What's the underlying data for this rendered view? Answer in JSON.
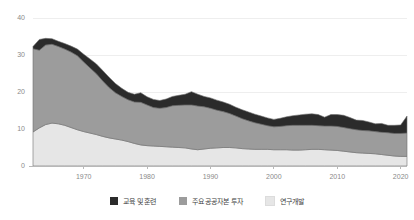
{
  "chart_data": {
    "type": "area",
    "title": "",
    "subtitle": "",
    "xlabel": "",
    "ylabel": "",
    "stacked": true,
    "grid": true,
    "legend_position": "bottom",
    "xlim": [
      1962,
      2021
    ],
    "ylim": [
      0,
      40
    ],
    "ytick_values": [
      0,
      10,
      20,
      30,
      40
    ],
    "ytick_labels": [
      "0",
      "10",
      "20",
      "30",
      "40"
    ],
    "xtick_values": [
      1970,
      1980,
      1990,
      2000,
      2010,
      2020
    ],
    "xtick_labels": [
      "1970",
      "1980",
      "1990",
      "2000",
      "2010",
      "2020"
    ],
    "x": [
      1962,
      1963,
      1964,
      1965,
      1966,
      1967,
      1968,
      1969,
      1970,
      1971,
      1972,
      1973,
      1974,
      1975,
      1976,
      1977,
      1978,
      1979,
      1980,
      1981,
      1982,
      1983,
      1984,
      1985,
      1986,
      1987,
      1988,
      1989,
      1990,
      1991,
      1992,
      1993,
      1994,
      1995,
      1996,
      1997,
      1998,
      1999,
      2000,
      2001,
      2002,
      2003,
      2004,
      2005,
      2006,
      2007,
      2008,
      2009,
      2010,
      2011,
      2012,
      2013,
      2014,
      2015,
      2016,
      2017,
      2018,
      2019,
      2020,
      2021
    ],
    "series": [
      {
        "name": "연구개발",
        "color": "#e6e6e6",
        "order": 1,
        "values": [
          9.2,
          10.3,
          11.2,
          11.6,
          11.4,
          11.0,
          10.4,
          9.8,
          9.3,
          8.9,
          8.5,
          8.0,
          7.6,
          7.3,
          7.0,
          6.6,
          6.1,
          5.7,
          5.5,
          5.4,
          5.3,
          5.2,
          5.1,
          5.0,
          4.9,
          4.6,
          4.4,
          4.6,
          4.8,
          4.9,
          5.0,
          5.0,
          4.9,
          4.7,
          4.6,
          4.5,
          4.5,
          4.5,
          4.4,
          4.4,
          4.4,
          4.3,
          4.3,
          4.4,
          4.5,
          4.5,
          4.4,
          4.3,
          4.2,
          4.0,
          3.8,
          3.6,
          3.5,
          3.4,
          3.3,
          3.1,
          2.9,
          2.7,
          2.6,
          2.6
        ]
      },
      {
        "name": "주요 공공자본 투자",
        "color": "#9c9c9c",
        "order": 2,
        "values": [
          22.5,
          21.0,
          21.5,
          21.3,
          20.9,
          20.6,
          20.4,
          20.0,
          18.8,
          17.6,
          16.4,
          15.0,
          13.6,
          12.5,
          11.8,
          11.3,
          11.2,
          11.5,
          11.0,
          10.4,
          10.3,
          10.6,
          11.2,
          11.4,
          11.6,
          11.9,
          11.8,
          11.4,
          10.8,
          10.2,
          9.7,
          9.2,
          8.6,
          8.1,
          7.6,
          7.2,
          6.8,
          6.4,
          6.2,
          6.3,
          6.5,
          6.7,
          6.7,
          6.6,
          6.5,
          6.4,
          6.4,
          6.5,
          6.5,
          6.4,
          6.3,
          6.2,
          6.1,
          6.1,
          6.0,
          6.0,
          6.1,
          6.1,
          6.2,
          6.3
        ]
      },
      {
        "name": "교육 및 훈련",
        "color": "#2b2b2b",
        "order": 3,
        "values": [
          0.6,
          2.9,
          1.8,
          1.5,
          1.4,
          1.5,
          1.6,
          1.8,
          2.1,
          2.4,
          2.7,
          2.8,
          2.8,
          2.5,
          2.2,
          2.0,
          2.1,
          2.6,
          2.2,
          2.2,
          2.1,
          2.3,
          2.5,
          2.7,
          2.9,
          3.6,
          3.2,
          2.8,
          2.8,
          2.7,
          2.6,
          2.5,
          2.4,
          2.4,
          2.4,
          2.3,
          2.2,
          2.1,
          2.0,
          2.2,
          2.4,
          2.6,
          2.8,
          3.0,
          3.1,
          3.0,
          2.4,
          3.1,
          3.2,
          3.3,
          3.0,
          2.6,
          2.7,
          2.4,
          2.1,
          2.4,
          2.0,
          2.2,
          2.3,
          4.6
        ]
      }
    ],
    "totals": [
      32.3,
      34.2,
      34.5,
      34.4,
      33.7,
      33.1,
      32.4,
      31.6,
      30.2,
      28.9,
      27.6,
      25.8,
      24.0,
      22.3,
      21.0,
      19.9,
      19.4,
      19.8,
      18.7,
      18.0,
      17.7,
      18.1,
      18.8,
      19.1,
      19.4,
      20.1,
      19.4,
      18.8,
      18.4,
      17.8,
      17.3,
      16.7,
      15.9,
      15.2,
      14.6,
      14.0,
      13.5,
      13.0,
      12.6,
      12.9,
      13.3,
      13.6,
      13.8,
      14.0,
      14.1,
      13.9,
      13.2,
      13.9,
      13.9,
      13.7,
      13.1,
      12.4,
      12.3,
      11.9,
      11.4,
      11.5,
      11.0,
      11.0,
      11.1,
      13.5
    ]
  },
  "legend": {
    "items": [
      {
        "label": "교육 및 훈련",
        "color": "#2b2b2b",
        "swatch_name": "legend-swatch-education"
      },
      {
        "label": "주요 공공자본 투자",
        "color": "#9c9c9c",
        "swatch_name": "legend-swatch-public-capital"
      },
      {
        "label": "연구개발",
        "color": "#e6e6e6",
        "swatch_name": "legend-swatch-rnd"
      }
    ]
  },
  "axis": {
    "y_labels": [
      "40",
      "30",
      "20",
      "10",
      "0"
    ],
    "x_labels": [
      "1970",
      "1980",
      "1990",
      "2000",
      "2010",
      "2020"
    ]
  }
}
